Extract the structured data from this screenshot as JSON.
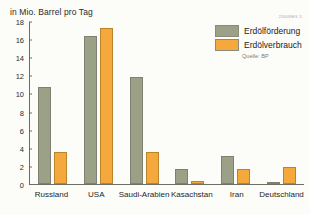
{
  "axis_title": "in Mio. Barrel pro Tag",
  "catalog_id": "23009EX-1",
  "legend": {
    "source": "Quelle: BP",
    "items": [
      {
        "label": "Erdölförderung",
        "color": "#9aa186"
      },
      {
        "label": "Erdölverbrauch",
        "color": "#f5a93c"
      }
    ]
  },
  "chart_data": {
    "type": "bar",
    "title": "in Mio. Barrel pro Tag",
    "xlabel": "",
    "ylabel": "in Mio. Barrel pro Tag",
    "ylim": [
      0,
      18
    ],
    "ytick_step": 2,
    "yticks": [
      18,
      16,
      14,
      12,
      10,
      8,
      6,
      4,
      2,
      0
    ],
    "grid": false,
    "legend_position": "top-right",
    "source": "Quelle: BP",
    "categories": [
      "Russland",
      "USA",
      "Saudi-Arabien",
      "Kasachstan",
      "Iran",
      "Deutschland"
    ],
    "series": [
      {
        "name": "Erdölförderung",
        "color": "#9aa186",
        "values": [
          10.7,
          16.4,
          11.8,
          1.7,
          3.1,
          0.1
        ]
      },
      {
        "name": "Erdölverbrauch",
        "color": "#f5a93c",
        "values": [
          3.5,
          17.2,
          3.5,
          0.3,
          1.7,
          1.9
        ]
      }
    ]
  }
}
